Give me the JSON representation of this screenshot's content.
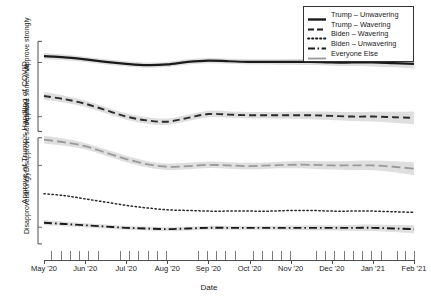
{
  "chart_data": {
    "type": "line",
    "title": "",
    "xlabel": "Date",
    "ylabel": "Approve of Trump's Handling of COVID",
    "grid": false,
    "legend_position": "top-right",
    "x_tick_labels": [
      "May '20",
      "Jun '20",
      "Jul '20",
      "Aug '20",
      "Sep '20",
      "Oct '20",
      "Nov '20",
      "Dec '20",
      "Jan '21",
      "Feb '21"
    ],
    "y_tick_labels": [
      "Disapprove strongly",
      "Disapprove somewhat",
      "Approve somewhat",
      "Approve strongly"
    ],
    "y_scale_note": "ordinal 4-point approval scale, 1 = Disapprove strongly, 4 = Approve strongly",
    "ylim": [
      0.55,
      4.25
    ],
    "xlim": [
      "2020-05-01",
      "2021-02-15"
    ],
    "x_months": [
      0,
      1,
      2,
      3,
      4,
      5,
      6,
      7,
      8,
      9
    ],
    "series": [
      {
        "name": "Trump – Unwavering",
        "style": "solid",
        "color": "#1a1a1a",
        "width": 2.2,
        "band": true,
        "x": [
          0,
          0.5,
          1,
          1.5,
          2,
          2.5,
          3,
          3.5,
          4,
          4.5,
          5,
          5.5,
          6,
          6.5,
          7,
          7.5,
          8,
          8.5,
          9
        ],
        "values": [
          3.72,
          3.7,
          3.67,
          3.63,
          3.6,
          3.58,
          3.59,
          3.63,
          3.65,
          3.64,
          3.63,
          3.63,
          3.63,
          3.63,
          3.62,
          3.62,
          3.62,
          3.61,
          3.6
        ],
        "band_half_width": [
          0.05,
          0.045,
          0.04,
          0.04,
          0.04,
          0.04,
          0.04,
          0.04,
          0.04,
          0.04,
          0.04,
          0.04,
          0.045,
          0.05,
          0.05,
          0.055,
          0.06,
          0.065,
          0.075
        ]
      },
      {
        "name": "Trump – Wavering",
        "style": "dashed",
        "color": "#2b2b2b",
        "width": 1.9,
        "band": true,
        "x": [
          0,
          0.5,
          1,
          1.5,
          2,
          2.5,
          3,
          3.5,
          4,
          4.5,
          5,
          5.5,
          6,
          6.5,
          7,
          7.5,
          8,
          8.5,
          9
        ],
        "values": [
          3.1,
          3.05,
          2.98,
          2.88,
          2.78,
          2.72,
          2.7,
          2.76,
          2.82,
          2.81,
          2.8,
          2.8,
          2.8,
          2.8,
          2.79,
          2.78,
          2.78,
          2.77,
          2.76
        ],
        "band_half_width": [
          0.06,
          0.055,
          0.05,
          0.05,
          0.05,
          0.05,
          0.05,
          0.05,
          0.05,
          0.05,
          0.05,
          0.05,
          0.055,
          0.06,
          0.065,
          0.07,
          0.075,
          0.085,
          0.1
        ]
      },
      {
        "name": "Everyone Else",
        "style": "long-dash",
        "color": "#9a9a9a",
        "width": 1.8,
        "band": true,
        "x": [
          0,
          0.5,
          1,
          1.5,
          2,
          2.5,
          3,
          3.5,
          4,
          4.5,
          5,
          5.5,
          6,
          6.5,
          7,
          7.5,
          8,
          8.5,
          9
        ],
        "values": [
          2.42,
          2.38,
          2.32,
          2.22,
          2.12,
          2.04,
          2.0,
          2.01,
          2.03,
          2.02,
          2.01,
          2.02,
          2.03,
          2.03,
          2.02,
          2.02,
          2.02,
          2.0,
          1.97
        ],
        "band_half_width": [
          0.06,
          0.055,
          0.05,
          0.05,
          0.05,
          0.05,
          0.05,
          0.05,
          0.05,
          0.05,
          0.05,
          0.05,
          0.055,
          0.06,
          0.065,
          0.07,
          0.075,
          0.085,
          0.1
        ]
      },
      {
        "name": "Biden – Wavering",
        "style": "dotted",
        "color": "#262626",
        "width": 1.5,
        "band": false,
        "x": [
          0,
          0.5,
          1,
          1.5,
          2,
          2.5,
          3,
          3.5,
          4,
          4.5,
          5,
          5.5,
          6,
          6.5,
          7,
          7.5,
          8,
          8.5,
          9
        ],
        "values": [
          1.58,
          1.55,
          1.5,
          1.45,
          1.4,
          1.36,
          1.33,
          1.32,
          1.31,
          1.31,
          1.31,
          1.31,
          1.32,
          1.32,
          1.31,
          1.31,
          1.31,
          1.3,
          1.29
        ]
      },
      {
        "name": "Biden – Unwavering",
        "style": "dash-dot",
        "color": "#1a1a1a",
        "width": 1.9,
        "band": true,
        "x": [
          0,
          0.5,
          1,
          1.5,
          2,
          2.5,
          3,
          3.5,
          4,
          4.5,
          5,
          5.5,
          6,
          6.5,
          7,
          7.5,
          8,
          8.5,
          9
        ],
        "values": [
          1.13,
          1.11,
          1.09,
          1.07,
          1.05,
          1.04,
          1.03,
          1.04,
          1.05,
          1.05,
          1.05,
          1.05,
          1.05,
          1.05,
          1.05,
          1.05,
          1.05,
          1.04,
          1.03
        ],
        "band_half_width": [
          0.04,
          0.035,
          0.03,
          0.03,
          0.03,
          0.03,
          0.03,
          0.03,
          0.03,
          0.03,
          0.03,
          0.03,
          0.035,
          0.04,
          0.04,
          0.045,
          0.05,
          0.055,
          0.065
        ]
      }
    ],
    "rug_marks": [
      0.02,
      0.045,
      0.07,
      0.095,
      0.12,
      0.145,
      0.205,
      0.23,
      0.255,
      0.28,
      0.305,
      0.33,
      0.415,
      0.44,
      0.465,
      0.49,
      0.515,
      0.565,
      0.59,
      0.615,
      0.64,
      0.665,
      0.735,
      0.76,
      0.785,
      0.81,
      0.835,
      0.86,
      0.885,
      0.91,
      0.955,
      0.975,
      1.0
    ]
  },
  "legend": {
    "items": [
      {
        "label": "Trump – Unwavering",
        "key": "solid-thick"
      },
      {
        "label": "Trump – Wavering",
        "key": "dashed"
      },
      {
        "label": "Biden – Wavering",
        "key": "dotted"
      },
      {
        "label": "Biden – Unwavering",
        "key": "dash-dot"
      },
      {
        "label": "Everyone Else",
        "key": "solid-gray"
      }
    ]
  }
}
